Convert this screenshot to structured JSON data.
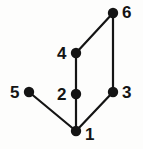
{
  "figure": {
    "kind": "undirected-graph-diagram",
    "title": "",
    "background_color": "#fdfdfc",
    "node_color": "#141414",
    "edge_color": "#141414",
    "label_color": "#141414",
    "node_radius": 5.2,
    "edge_width": 2.2,
    "width": 143,
    "height": 149
  },
  "chart_data": {
    "type": "graph",
    "title": "",
    "xlabel": "",
    "ylabel": "",
    "directed": false,
    "node_count": 6,
    "edge_count": 6,
    "nodes": [
      {
        "id": "1",
        "label": "1",
        "x": 76,
        "y": 131,
        "label_x": 85,
        "label_y": 126,
        "degree": 3
      },
      {
        "id": "2",
        "label": "2",
        "x": 76,
        "y": 94,
        "label_x": 57,
        "label_y": 86,
        "degree": 2
      },
      {
        "id": "3",
        "label": "3",
        "x": 113,
        "y": 92,
        "label_x": 122,
        "label_y": 84,
        "degree": 2
      },
      {
        "id": "4",
        "label": "4",
        "x": 76,
        "y": 53,
        "label_x": 57,
        "label_y": 45,
        "degree": 2
      },
      {
        "id": "5",
        "label": "5",
        "x": 29,
        "y": 92,
        "label_x": 10,
        "label_y": 84,
        "degree": 1
      },
      {
        "id": "6",
        "label": "6",
        "x": 113,
        "y": 13,
        "label_x": 122,
        "label_y": 4,
        "degree": 2
      }
    ],
    "edges": [
      {
        "source": "4",
        "target": "6",
        "x1": 76,
        "y1": 53,
        "x2": 113,
        "y2": 13
      },
      {
        "source": "6",
        "target": "3",
        "x1": 113,
        "y1": 13,
        "x2": 113,
        "y2": 92
      },
      {
        "source": "4",
        "target": "2",
        "x1": 76,
        "y1": 53,
        "x2": 76,
        "y2": 94
      },
      {
        "source": "2",
        "target": "1",
        "x1": 76,
        "y1": 94,
        "x2": 76,
        "y2": 131
      },
      {
        "source": "3",
        "target": "1",
        "x1": 113,
        "y1": 92,
        "x2": 76,
        "y2": 131
      },
      {
        "source": "5",
        "target": "1",
        "x1": 29,
        "y1": 92,
        "x2": 76,
        "y2": 131
      }
    ]
  }
}
